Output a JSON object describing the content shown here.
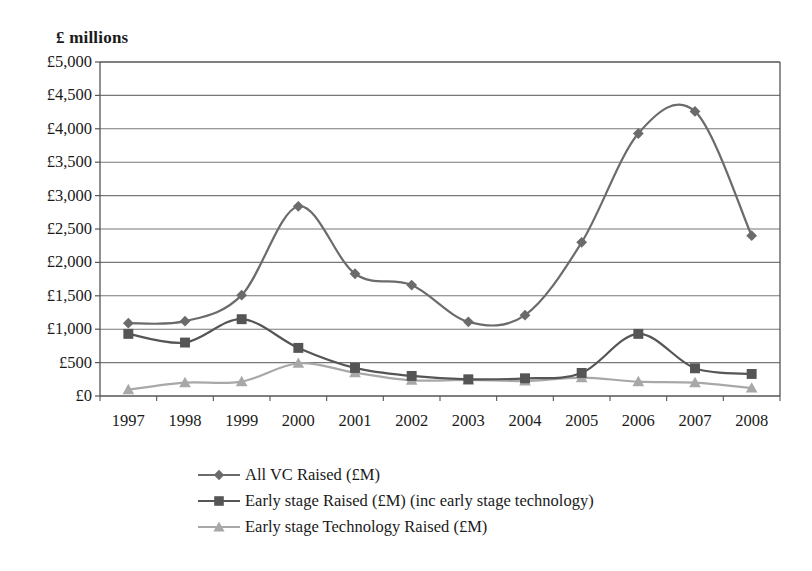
{
  "chart_data": {
    "type": "line",
    "title": "",
    "ylabel": "£ millions",
    "xlabel": "",
    "categories": [
      "1997",
      "1998",
      "1999",
      "2000",
      "2001",
      "2002",
      "2003",
      "2004",
      "2005",
      "2006",
      "2007",
      "2008"
    ],
    "ylim": [
      0,
      5000
    ],
    "ytick_step": 500,
    "ytick_labels": [
      "£5,000",
      "£4,500",
      "£4,000",
      "£3,500",
      "£3,000",
      "£2,500",
      "£2,000",
      "£1,500",
      "£1,000",
      "£500",
      "£0"
    ],
    "ytick_values": [
      5000,
      4500,
      4000,
      3500,
      3000,
      2500,
      2000,
      1500,
      1000,
      500,
      0
    ],
    "grid": true,
    "grid_axis": "y",
    "smoothed": true,
    "legend_position": "bottom",
    "series": [
      {
        "name": "All VC Raised (£M)",
        "marker": "diamond",
        "color": "#6b6b6b",
        "values": [
          1090,
          1120,
          1510,
          2840,
          1830,
          1660,
          1110,
          1210,
          2300,
          3930,
          4260,
          2400
        ]
      },
      {
        "name": "Early stage Raised (£M) (inc early stage technology)",
        "marker": "square",
        "color": "#555555",
        "values": [
          930,
          800,
          1150,
          720,
          420,
          300,
          250,
          265,
          345,
          930,
          415,
          330
        ]
      },
      {
        "name": "Early stage Technology Raised (£M)",
        "marker": "triangle",
        "color": "#a8a8a8",
        "values": [
          95,
          200,
          215,
          490,
          350,
          235,
          240,
          225,
          275,
          215,
          200,
          120
        ]
      }
    ]
  },
  "colors": {
    "axis": "#555555",
    "grid": "#777777",
    "series_all_vc": "#6b6b6b",
    "series_early_stage": "#555555",
    "series_early_tech": "#a8a8a8",
    "text": "#1a1a1a",
    "background": "#ffffff"
  }
}
